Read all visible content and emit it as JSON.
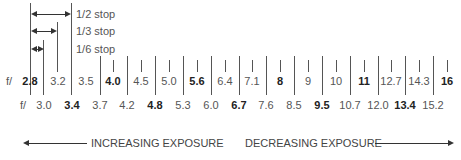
{
  "legend": {
    "half_stop": "1/2 stop",
    "third_stop": "1/3 stop",
    "sixth_stop": "1/6 stop"
  },
  "top_row": {
    "prefix": "f/",
    "values": [
      "2.8",
      "3.2",
      "3.5",
      "4.0",
      "4.5",
      "5.0",
      "5.6",
      "6.4",
      "7.1",
      "8",
      "9",
      "10",
      "11",
      "12.7",
      "14.3",
      "16"
    ],
    "bold": [
      "2.8",
      "4.0",
      "5.6",
      "8",
      "11",
      "16"
    ]
  },
  "bottom_row": {
    "prefix": "f/",
    "values": [
      "3.0",
      "3.4",
      "3.7",
      "4.2",
      "4.8",
      "5.3",
      "6.0",
      "6.7",
      "7.6",
      "8.5",
      "9.5",
      "10.7",
      "12.0",
      "13.4",
      "15.2"
    ],
    "bold": [
      "3.4",
      "4.8",
      "6.7",
      "9.5",
      "13.4"
    ]
  },
  "captions": {
    "left": "INCREASING EXPOSURE",
    "right": "DECREASING EXPOSURE"
  }
}
